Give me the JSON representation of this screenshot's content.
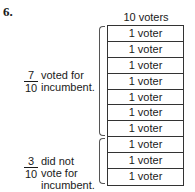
{
  "problem_number": "6.",
  "header": "10 voters",
  "rows": [
    "1 voter",
    "1 voter",
    "1 voter",
    "1 voter",
    "1 voter",
    "1 voter",
    "1 voter",
    "1 voter",
    "1 voter",
    "1 voter"
  ],
  "group_voted": {
    "numerator": "7",
    "denominator": "10",
    "line1": "voted for",
    "line2": "incumbent."
  },
  "group_not_voted": {
    "numerator": "3",
    "denominator": "10",
    "line1": "did not",
    "line2": "vote for",
    "line3": "incumbent."
  }
}
